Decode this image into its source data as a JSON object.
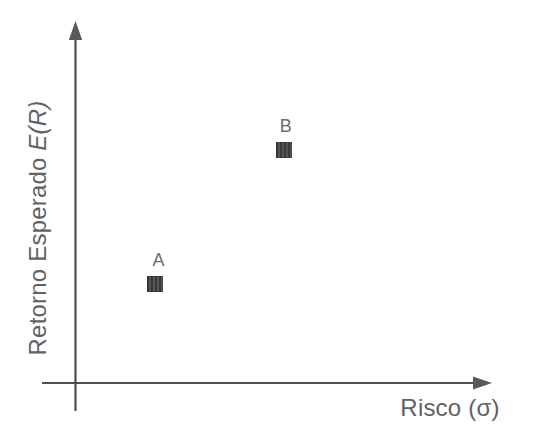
{
  "figure": {
    "kind": "risk-return-scatter-diagram",
    "background_color": "#ffffff"
  },
  "axes": {
    "y_label_prefix": "Retorno Esperado",
    "y_label_math": "E(R)",
    "x_label": "Risco (σ)"
  },
  "colors": {
    "axis_line": "#4c4e50",
    "arrowhead": "#57595b",
    "label_text": "#5f6265",
    "point_label_text": "#6b6e71",
    "marker_fill": "#4a4a4a"
  },
  "chart_data": {
    "type": "scatter",
    "title": "",
    "xlabel": "Risco (σ)",
    "ylabel": "Retorno Esperado E(R)",
    "x_range": [
      0,
      1
    ],
    "y_range": [
      0,
      1
    ],
    "grid": false,
    "legend": false,
    "tick_labels": "none",
    "points": [
      {
        "name": "A",
        "x": 0.19,
        "y": 0.28,
        "marker": "square",
        "label_dx": 4
      },
      {
        "name": "B",
        "x": 0.5,
        "y": 0.66,
        "marker": "square",
        "label_dx": 2
      }
    ]
  }
}
